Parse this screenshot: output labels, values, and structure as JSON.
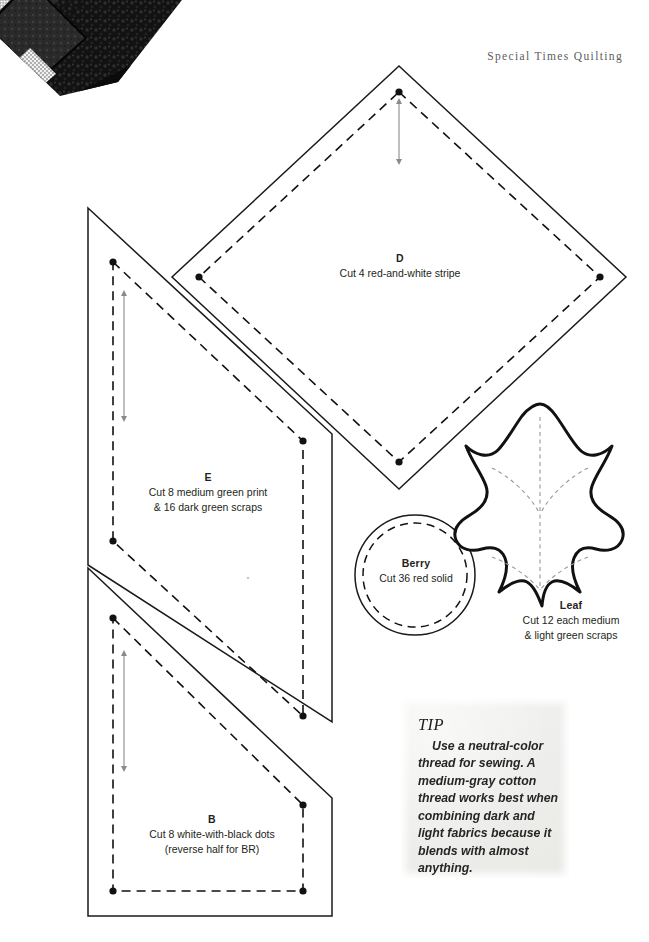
{
  "page": {
    "background_color": "#ffffff",
    "width": 649,
    "height": 942
  },
  "header": {
    "title": "Special Times Quilting"
  },
  "photo": {
    "name": "quilt-corner-photo",
    "description": "Black and white pieced quilt corner"
  },
  "pieces": [
    {
      "id": "D",
      "name": "D",
      "shape": "diamond",
      "lines": [
        "Cut 4 red-and-white stripe"
      ]
    },
    {
      "id": "E",
      "name": "E",
      "shape": "quadrilateral",
      "lines": [
        "Cut 8 medium green print",
        "& 16 dark green scraps"
      ]
    },
    {
      "id": "B",
      "name": "B",
      "shape": "quadrilateral",
      "lines": [
        "Cut 8 white-with-black dots",
        "(reverse half for BR)"
      ]
    },
    {
      "id": "berry",
      "name": "Berry",
      "shape": "circle",
      "lines": [
        "Cut 36 red solid"
      ]
    },
    {
      "id": "leaf",
      "name": "Leaf",
      "shape": "leaf",
      "lines": [
        "Cut 12 each medium",
        "& light green scraps"
      ]
    }
  ],
  "tip": {
    "title": "TIP",
    "body": "Use a neutral-color thread for sewing. A medium-gray cotton thread works best when combining dark and light fabrics because it blends with almost anything."
  },
  "colors": {
    "cut_line": "#1a1a1a",
    "seam_line": "#111111",
    "grain_line": "#8a8a8a",
    "leaf_outline": "#111111",
    "tip_background": "#efefec",
    "header_text": "#5d5d5d",
    "label_text": "#231f20"
  }
}
